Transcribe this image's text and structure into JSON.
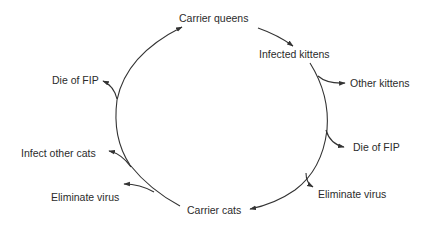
{
  "diagram": {
    "type": "cycle",
    "topic": "FIP virus carrier cycle",
    "nodes": {
      "carrier_queens": "Carrier queens",
      "infected_kittens": "Infected kittens",
      "other_kittens": "Other kittens",
      "die_of_fip_right": "Die of FIP",
      "eliminate_virus_right": "Eliminate virus",
      "carrier_cats": "Carrier cats",
      "eliminate_virus_left": "Eliminate virus",
      "infect_other_cats": "Infect other cats",
      "die_of_fip_left": "Die of FIP"
    },
    "edges": [
      {
        "from": "Carrier queens",
        "to": "Infected kittens"
      },
      {
        "from": "Infected kittens",
        "to": "Other kittens"
      },
      {
        "from": "Infected kittens",
        "to": "Die of FIP"
      },
      {
        "from": "Infected kittens",
        "to": "Eliminate virus"
      },
      {
        "from": "Infected kittens",
        "to": "Carrier cats"
      },
      {
        "from": "Carrier cats",
        "to": "Eliminate virus"
      },
      {
        "from": "Carrier cats",
        "to": "Infect other cats"
      },
      {
        "from": "Carrier cats",
        "to": "Die of FIP"
      },
      {
        "from": "Carrier cats",
        "to": "Carrier queens"
      }
    ],
    "colors": {
      "line": "#333333",
      "text": "#2b2b2b",
      "background": "#ffffff"
    }
  }
}
